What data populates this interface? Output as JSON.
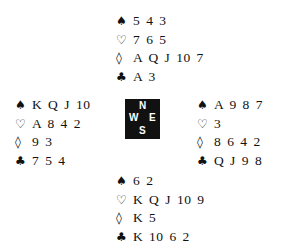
{
  "suit_symbols": {
    "spades": "♠",
    "hearts": "♡",
    "diamonds": "◊",
    "clubs": "♣"
  },
  "hands": {
    "north": {
      "spades": "5 4 3",
      "hearts": "7 6 5",
      "diamonds": "A Q J 10 7",
      "clubs": "A 3"
    },
    "west": {
      "spades": "K Q J 10",
      "hearts": "A 8 4 2",
      "diamonds": "9 3",
      "clubs": "7 5 4"
    },
    "east": {
      "spades": "A 9 8 7",
      "hearts": "3",
      "diamonds": "8 6 4 2",
      "clubs": "Q J 9 8"
    },
    "south": {
      "spades": "6 2",
      "hearts": "K Q J 10 9",
      "diamonds": "K 5",
      "clubs": "K 10 6 2"
    }
  },
  "compass": {
    "north": "N",
    "south": "S",
    "west": "W",
    "east": "E"
  }
}
